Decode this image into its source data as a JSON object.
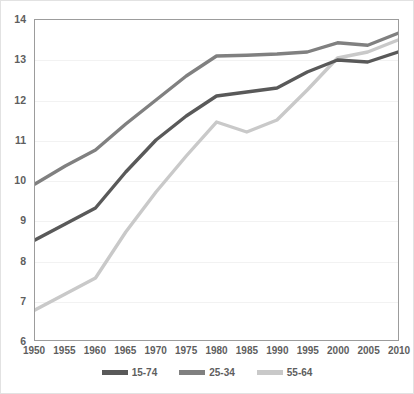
{
  "chart_data": {
    "type": "line",
    "title": "",
    "subtitle": "",
    "xlabel": "",
    "ylabel": "",
    "categories": [
      "1950",
      "1955",
      "1960",
      "1965",
      "1970",
      "1975",
      "1980",
      "1985",
      "1990",
      "1995",
      "2000",
      "2005",
      "2010"
    ],
    "x": [
      1950,
      1955,
      1960,
      1965,
      1970,
      1975,
      1980,
      1985,
      1990,
      1995,
      2000,
      2005,
      2010
    ],
    "xlim": [
      1950,
      2010
    ],
    "ylim": [
      6,
      14
    ],
    "y_ticks": [
      6,
      7,
      8,
      9,
      10,
      11,
      12,
      13,
      14
    ],
    "x_ticks": [
      1950,
      1955,
      1960,
      1965,
      1970,
      1975,
      1980,
      1985,
      1990,
      1995,
      2000,
      2005,
      2010
    ],
    "grid": "horizontal",
    "legend_position": "bottom",
    "series": [
      {
        "name": "15-74",
        "color": "#595959",
        "values": [
          8.5,
          8.9,
          9.3,
          10.2,
          11.0,
          11.6,
          12.1,
          12.2,
          12.3,
          12.7,
          13.0,
          12.95,
          13.2
        ]
      },
      {
        "name": "25-34",
        "color": "#808080",
        "values": [
          9.9,
          10.35,
          10.75,
          11.4,
          12.0,
          12.6,
          13.1,
          13.12,
          13.15,
          13.2,
          13.43,
          13.37,
          13.67
        ]
      },
      {
        "name": "55-64",
        "color": "#c9c9c9",
        "values": [
          6.75,
          7.15,
          7.55,
          8.7,
          9.7,
          10.6,
          11.45,
          11.2,
          11.5,
          12.25,
          13.05,
          13.2,
          13.5
        ]
      }
    ]
  },
  "axes": {
    "y_tick_labels": [
      "14",
      "13",
      "12",
      "11",
      "10",
      "9",
      "8",
      "7",
      "6"
    ],
    "x_tick_labels": [
      "1950",
      "1955",
      "1960",
      "1965",
      "1970",
      "1975",
      "1980",
      "1985",
      "1990",
      "1995",
      "2000",
      "2005",
      "2010"
    ]
  },
  "legend": {
    "items": [
      {
        "label": "15-74",
        "color": "#595959"
      },
      {
        "label": "25-34",
        "color": "#808080"
      },
      {
        "label": "55-64",
        "color": "#c9c9c9"
      }
    ]
  },
  "style": {
    "background": "#ffffff",
    "border_color": "#e2e2e2",
    "axis_color": "#9c9c9c",
    "gridline_color": "#f2f2f2",
    "tick_label_color": "#5e5e5e"
  }
}
